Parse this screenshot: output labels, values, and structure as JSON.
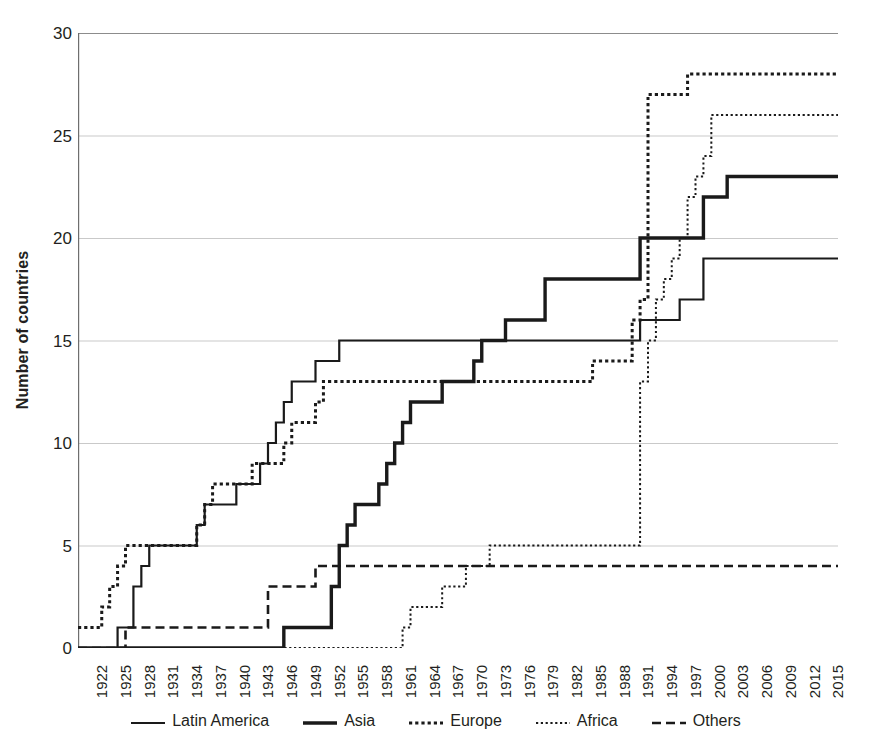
{
  "chart_data": {
    "type": "line",
    "title": "",
    "subtitle": "",
    "xlabel": "",
    "ylabel": "Number of countries",
    "xlim": [
      1919,
      2015
    ],
    "ylim": [
      0,
      30
    ],
    "grid": "horizontal",
    "legend_position": "bottom",
    "step_style": "post",
    "y_ticks": [
      0,
      5,
      10,
      15,
      20,
      25,
      30
    ],
    "x_ticks": [
      1922,
      1925,
      1928,
      1931,
      1934,
      1937,
      1940,
      1943,
      1946,
      1949,
      1952,
      1955,
      1958,
      1961,
      1964,
      1967,
      1970,
      1973,
      1976,
      1979,
      1982,
      1985,
      1988,
      1991,
      1994,
      1997,
      2000,
      2003,
      2006,
      2009,
      2012,
      2015
    ],
    "categories": [
      1919,
      2015
    ],
    "series": [
      {
        "name": "Latin America",
        "style": "solid-thin",
        "color": "#1a1a1a",
        "points": [
          [
            1919,
            0
          ],
          [
            1923,
            0
          ],
          [
            1924,
            1
          ],
          [
            1925,
            1
          ],
          [
            1926,
            3
          ],
          [
            1927,
            4
          ],
          [
            1928,
            5
          ],
          [
            1933,
            5
          ],
          [
            1934,
            6
          ],
          [
            1935,
            7
          ],
          [
            1938,
            7
          ],
          [
            1939,
            8
          ],
          [
            1941,
            8
          ],
          [
            1942,
            9
          ],
          [
            1943,
            10
          ],
          [
            1944,
            11
          ],
          [
            1945,
            12
          ],
          [
            1946,
            13
          ],
          [
            1948,
            13
          ],
          [
            1949,
            14
          ],
          [
            1951,
            14
          ],
          [
            1952,
            15
          ],
          [
            1989,
            15
          ],
          [
            1990,
            16
          ],
          [
            1994,
            16
          ],
          [
            1995,
            17
          ],
          [
            1997,
            17
          ],
          [
            1998,
            19
          ],
          [
            2015,
            19
          ]
        ]
      },
      {
        "name": "Asia",
        "style": "solid-thick",
        "color": "#1a1a1a",
        "points": [
          [
            1919,
            0
          ],
          [
            1944,
            0
          ],
          [
            1945,
            1
          ],
          [
            1950,
            1
          ],
          [
            1951,
            3
          ],
          [
            1952,
            5
          ],
          [
            1953,
            6
          ],
          [
            1954,
            7
          ],
          [
            1956,
            7
          ],
          [
            1957,
            8
          ],
          [
            1958,
            9
          ],
          [
            1959,
            10
          ],
          [
            1960,
            11
          ],
          [
            1961,
            12
          ],
          [
            1964,
            12
          ],
          [
            1965,
            13
          ],
          [
            1968,
            13
          ],
          [
            1969,
            14
          ],
          [
            1970,
            15
          ],
          [
            1972,
            15
          ],
          [
            1973,
            16
          ],
          [
            1977,
            16
          ],
          [
            1978,
            18
          ],
          [
            1988,
            18
          ],
          [
            1990,
            20
          ],
          [
            1997,
            20
          ],
          [
            1998,
            22
          ],
          [
            2000,
            22
          ],
          [
            2001,
            23
          ],
          [
            2015,
            23
          ]
        ]
      },
      {
        "name": "Europe",
        "style": "dotted-thick",
        "color": "#1a1a1a",
        "points": [
          [
            1919,
            1
          ],
          [
            1921,
            1
          ],
          [
            1922,
            2
          ],
          [
            1923,
            3
          ],
          [
            1924,
            4
          ],
          [
            1925,
            5
          ],
          [
            1933,
            5
          ],
          [
            1934,
            6
          ],
          [
            1935,
            7
          ],
          [
            1936,
            8
          ],
          [
            1940,
            8
          ],
          [
            1941,
            9
          ],
          [
            1944,
            9
          ],
          [
            1945,
            10
          ],
          [
            1946,
            11
          ],
          [
            1948,
            11
          ],
          [
            1949,
            12
          ],
          [
            1950,
            13
          ],
          [
            1983,
            13
          ],
          [
            1984,
            14
          ],
          [
            1988,
            14
          ],
          [
            1989,
            16
          ],
          [
            1990,
            17
          ],
          [
            1991,
            27
          ],
          [
            1995,
            27
          ],
          [
            1996,
            28
          ],
          [
            2015,
            28
          ]
        ]
      },
      {
        "name": "Africa",
        "style": "dotted-thin",
        "color": "#1a1a1a",
        "points": [
          [
            1919,
            0
          ],
          [
            1959,
            0
          ],
          [
            1960,
            1
          ],
          [
            1961,
            2
          ],
          [
            1964,
            2
          ],
          [
            1965,
            3
          ],
          [
            1967,
            3
          ],
          [
            1968,
            4
          ],
          [
            1970,
            4
          ],
          [
            1971,
            5
          ],
          [
            1989,
            5
          ],
          [
            1990,
            13
          ],
          [
            1991,
            15
          ],
          [
            1992,
            17
          ],
          [
            1993,
            18
          ],
          [
            1994,
            19
          ],
          [
            1995,
            20
          ],
          [
            1996,
            22
          ],
          [
            1997,
            23
          ],
          [
            1998,
            24
          ],
          [
            1999,
            26
          ],
          [
            2015,
            26
          ]
        ]
      },
      {
        "name": "Others",
        "style": "dashed",
        "color": "#1a1a1a",
        "points": [
          [
            1919,
            0
          ],
          [
            1924,
            0
          ],
          [
            1925,
            1
          ],
          [
            1942,
            1
          ],
          [
            1943,
            3
          ],
          [
            1948,
            3
          ],
          [
            1949,
            4
          ],
          [
            2015,
            4
          ]
        ]
      }
    ]
  },
  "legend": {
    "items": [
      {
        "label": "Latin America",
        "style": "solid-thin"
      },
      {
        "label": "Asia",
        "style": "solid-thick"
      },
      {
        "label": "Europe",
        "style": "dotted-thick"
      },
      {
        "label": "Africa",
        "style": "dotted-thin"
      },
      {
        "label": "Others",
        "style": "dashed"
      }
    ]
  },
  "axes": {
    "y_title": "Number of countries"
  }
}
